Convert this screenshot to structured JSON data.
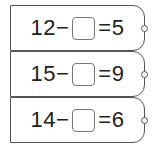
{
  "problems": [
    {
      "left": "12",
      "op": "−",
      "equals": "=",
      "result": "5"
    },
    {
      "left": "15",
      "op": "−",
      "equals": "=",
      "result": "9"
    },
    {
      "left": "14",
      "op": "−",
      "equals": "=",
      "result": "6"
    }
  ]
}
